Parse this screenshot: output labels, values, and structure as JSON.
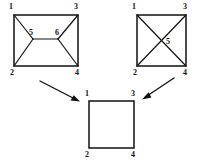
{
  "diagram": {
    "background_color": "#ffffff",
    "line_color": "#111111",
    "figures": [
      {
        "id": "left-rectangle",
        "name": "rectangle-with-inner-trapezoid",
        "shape": "rectangle",
        "outer_vertices": [
          {
            "label": "1",
            "x": 14,
            "y": 15,
            "label_x": 11,
            "label_y": 7
          },
          {
            "label": "3",
            "x": 78,
            "y": 15,
            "label_x": 76,
            "label_y": 7
          },
          {
            "label": "4",
            "x": 78,
            "y": 66,
            "label_x": 77,
            "label_y": 73
          },
          {
            "label": "2",
            "x": 14,
            "y": 66,
            "label_x": 12,
            "label_y": 73
          }
        ],
        "inner_vertices": [
          {
            "label": "5",
            "x": 33,
            "y": 39,
            "label_x": 31,
            "label_y": 33
          },
          {
            "label": "6",
            "x": 58,
            "y": 39,
            "label_x": 57,
            "label_y": 33
          }
        ],
        "inner_edges": [
          [
            "1",
            "5"
          ],
          [
            "2",
            "5"
          ],
          [
            "5",
            "6"
          ],
          [
            "3",
            "6"
          ],
          [
            "4",
            "6"
          ]
        ]
      },
      {
        "id": "right-square",
        "name": "square-with-diagonals",
        "shape": "square",
        "outer_vertices": [
          {
            "label": "1",
            "x": 137,
            "y": 15,
            "label_x": 134,
            "label_y": 7
          },
          {
            "label": "3",
            "x": 186,
            "y": 15,
            "label_x": 185,
            "label_y": 7
          },
          {
            "label": "4",
            "x": 186,
            "y": 66,
            "label_x": 185,
            "label_y": 73
          },
          {
            "label": "2",
            "x": 137,
            "y": 66,
            "label_x": 135,
            "label_y": 73
          }
        ],
        "inner_vertices": [
          {
            "label": "5",
            "x": 161,
            "y": 41,
            "label_x": 168,
            "label_y": 42
          }
        ],
        "inner_edges": [
          [
            "1",
            "4"
          ],
          [
            "2",
            "3"
          ]
        ]
      },
      {
        "id": "bottom-square",
        "name": "plain-square",
        "shape": "square",
        "outer_vertices": [
          {
            "label": "1",
            "x": 89,
            "y": 101,
            "label_x": 87,
            "label_y": 94
          },
          {
            "label": "3",
            "x": 134,
            "y": 101,
            "label_x": 133,
            "label_y": 94
          },
          {
            "label": "4",
            "x": 134,
            "y": 148,
            "label_x": 133,
            "label_y": 155
          },
          {
            "label": "2",
            "x": 89,
            "y": 148,
            "label_x": 87,
            "label_y": 155
          }
        ],
        "inner_vertices": [],
        "inner_edges": []
      }
    ],
    "arrows": [
      {
        "id": "arrow-left-to-bottom",
        "name": "arrow-left-figure-to-result",
        "from": "left-rectangle",
        "to": "bottom-square",
        "x1": 40,
        "y1": 81,
        "x2": 79,
        "y2": 101
      },
      {
        "id": "arrow-right-to-bottom",
        "name": "arrow-right-figure-to-result",
        "from": "right-square",
        "to": "bottom-square",
        "x1": 174,
        "y1": 78,
        "x2": 143,
        "y2": 98
      }
    ]
  }
}
